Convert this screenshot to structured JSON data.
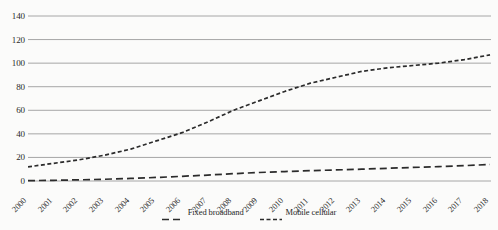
{
  "chart_data": {
    "type": "line",
    "title": "",
    "xlabel": "",
    "ylabel": "",
    "x": [
      2000,
      2001,
      2002,
      2003,
      2004,
      2005,
      2006,
      2007,
      2008,
      2009,
      2010,
      2011,
      2012,
      2013,
      2014,
      2015,
      2016,
      2017,
      2018
    ],
    "categories": [
      "2000",
      "2001",
      "2002",
      "2003",
      "2004",
      "2005",
      "2006",
      "2007",
      "2008",
      "2009",
      "2010",
      "2011",
      "2012",
      "2013",
      "2014",
      "2015",
      "2016",
      "2017",
      "2018"
    ],
    "series": [
      {
        "name": "Fixed broadband",
        "dash": "dashed",
        "color": "#2b2b2b",
        "values": [
          0.3,
          0.6,
          1.0,
          1.5,
          2.2,
          3.0,
          4.0,
          5.0,
          6.2,
          7.2,
          8.0,
          8.8,
          9.4,
          10.0,
          10.8,
          11.5,
          12.2,
          13.0,
          14.0
        ]
      },
      {
        "name": "Mobile cellular",
        "dash": "dotted-dash",
        "color": "#2b2b2b",
        "values": [
          12,
          15,
          18,
          22,
          27,
          34,
          41,
          50,
          60,
          68,
          76,
          83,
          88,
          93,
          96,
          98,
          100,
          103,
          107
        ]
      }
    ],
    "ylim": [
      0,
      140
    ],
    "yticks": [
      0,
      20,
      40,
      60,
      80,
      100,
      120,
      140
    ],
    "ytick_labels": [
      "0",
      "20",
      "40",
      "60",
      "80",
      "100",
      "120",
      "140"
    ],
    "grid": true,
    "grid_axis": "y",
    "grid_color": "#a6a6a6",
    "legend_position": "bottom",
    "background_color": "#fbfbfa"
  },
  "legend": {
    "items": [
      {
        "label": "Fixed broadband"
      },
      {
        "label": "Mobile cellular"
      }
    ]
  }
}
